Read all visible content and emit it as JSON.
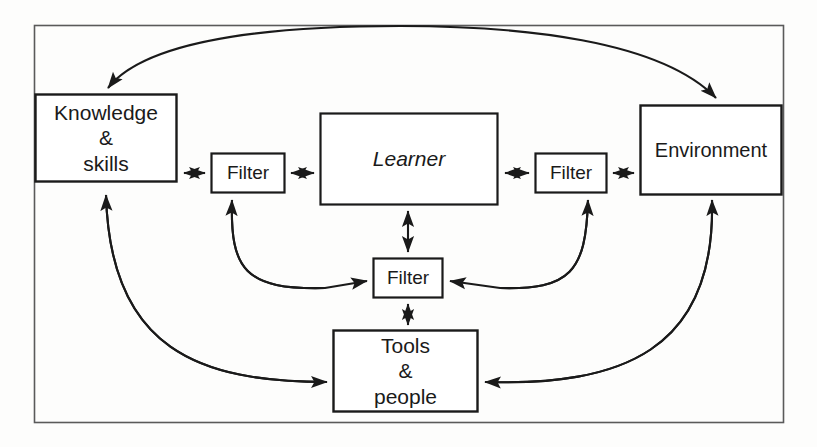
{
  "diagram": {
    "frame": {
      "x": 34,
      "y": 25,
      "width": 750,
      "height": 398,
      "stroke": "#4a4a4a"
    },
    "stroke_color": "#1a1a1a",
    "background": "#fdfdfc",
    "nodes": [
      {
        "id": "knowledge-skills",
        "label": "Knowledge\n&\nskills",
        "x": 35,
        "y": 94,
        "width": 142,
        "height": 88,
        "text_style": "lbl-big"
      },
      {
        "id": "filter-left",
        "label": "Filter",
        "x": 211,
        "y": 153,
        "width": 74,
        "height": 40,
        "text_style": "lbl-small"
      },
      {
        "id": "learner",
        "label": "Learner",
        "x": 320,
        "y": 113,
        "width": 178,
        "height": 92,
        "text_style": "lbl-italic"
      },
      {
        "id": "filter-right",
        "label": "Filter",
        "x": 535,
        "y": 153,
        "width": 72,
        "height": 40,
        "text_style": "lbl-small"
      },
      {
        "id": "environment",
        "label": "Environment",
        "x": 640,
        "y": 105,
        "width": 142,
        "height": 90,
        "text_style": "lbl-mid"
      },
      {
        "id": "filter-center",
        "label": "Filter",
        "x": 373,
        "y": 258,
        "width": 70,
        "height": 40,
        "text_style": "lbl-small"
      },
      {
        "id": "tools-people",
        "label": "Tools\n&\npeople",
        "x": 333,
        "y": 330,
        "width": 145,
        "height": 82,
        "text_style": "lbl-big"
      }
    ],
    "connectors": [
      {
        "id": "arc-knowledge-environment",
        "kind": "double-arc",
        "from": "knowledge-skills",
        "to": "environment"
      },
      {
        "id": "knowledge-filterleft",
        "kind": "double-straight",
        "from": "knowledge-skills",
        "to": "filter-left"
      },
      {
        "id": "filterleft-learner",
        "kind": "double-straight",
        "from": "filter-left",
        "to": "learner"
      },
      {
        "id": "learner-filterright",
        "kind": "double-straight",
        "from": "learner",
        "to": "filter-right"
      },
      {
        "id": "filterright-environment",
        "kind": "double-straight",
        "from": "filter-right",
        "to": "environment"
      },
      {
        "id": "learner-filtercenter",
        "kind": "double-vertical",
        "from": "learner",
        "to": "filter-center"
      },
      {
        "id": "filtercenter-toolspeople",
        "kind": "double-vertical",
        "from": "filter-center",
        "to": "tools-people"
      },
      {
        "id": "curve-toolspeople-filterleft",
        "kind": "curve-arrow",
        "from": "tools-people",
        "to": "filter-left"
      },
      {
        "id": "curve-toolspeople-filtercenter-left",
        "kind": "curve-arrow",
        "from": "tools-people",
        "to": "filter-center"
      },
      {
        "id": "curve-toolspeople-filterright",
        "kind": "curve-arrow",
        "from": "tools-people",
        "to": "filter-right"
      },
      {
        "id": "curve-environment-filtercenter",
        "kind": "curve-arrow",
        "from": "environment",
        "to": "filter-center"
      },
      {
        "id": "curve-toolspeople-knowledge",
        "kind": "curve-arrow",
        "from": "tools-people",
        "to": "knowledge-skills"
      },
      {
        "id": "curve-environment-toolspeople",
        "kind": "curve-arrow",
        "from": "environment",
        "to": "tools-people"
      }
    ]
  }
}
